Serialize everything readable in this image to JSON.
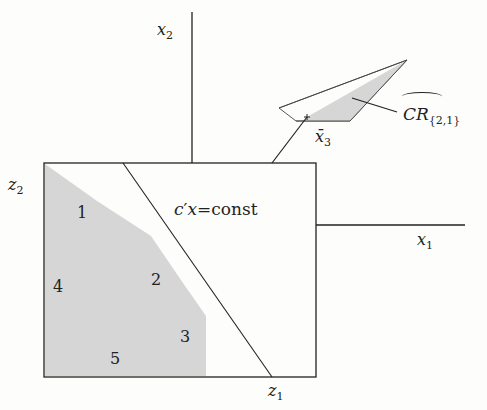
{
  "diagram": {
    "axes": {
      "x1_label": "x",
      "x1_sub": "1",
      "x2_label": "x",
      "x2_sub": "2",
      "z1_label": "z",
      "z1_sub": "1",
      "z2_label": "z",
      "z2_sub": "2"
    },
    "regions": [
      "1",
      "2",
      "3",
      "4",
      "5"
    ],
    "line_label": {
      "c": "c",
      "prime": "′",
      "x": "x",
      "eq": "=",
      "const": "const"
    },
    "point_label": {
      "name": "x̄",
      "sub": "3"
    },
    "confidence_region_label": {
      "name": "CR",
      "sub": "{2,1}",
      "hat": "^"
    },
    "colors": {
      "shade": "#d6d6d6",
      "line": "#222222"
    }
  }
}
